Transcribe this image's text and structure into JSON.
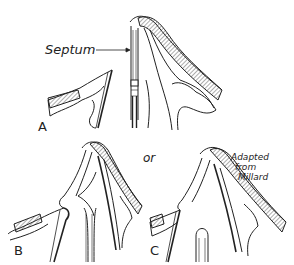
{
  "figure": {
    "ink_color": "#222222",
    "background": "#ffffff",
    "labels": {
      "septum": "Septum",
      "panel_a": "A",
      "panel_b": "B",
      "panel_c": "C",
      "or": "or",
      "credit_line1": "Adapted",
      "credit_line2": "from",
      "credit_line3": "Millard"
    }
  }
}
